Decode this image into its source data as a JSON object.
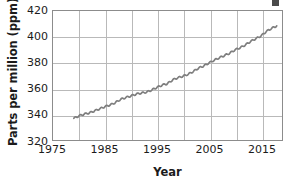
{
  "chart_data": {
    "type": "line",
    "title": "",
    "subtitle": "",
    "xlabel": "Year",
    "ylabel": "Parts per million (ppm)",
    "xlim": [
      1975,
      2019
    ],
    "ylim": [
      320,
      420
    ],
    "grid": true,
    "legend": null,
    "legend_position": "none",
    "x_ticks": [
      1975,
      1985,
      1995,
      2005,
      2015
    ],
    "x_tick_labels": [
      "1975",
      "1985",
      "1995",
      "2005",
      "2015"
    ],
    "x_gridline_values": [
      1975,
      1980,
      1985,
      1990,
      1995,
      2000,
      2005,
      2010,
      2015
    ],
    "y_ticks": [
      320,
      340,
      360,
      380,
      400,
      420
    ],
    "y_tick_labels": [
      "320",
      "340",
      "360",
      "380",
      "400",
      "420"
    ],
    "y_gridline_values": [
      320,
      340,
      360,
      380,
      400,
      420
    ],
    "series": [
      {
        "name": "Atmospheric CO2 concentration",
        "color": "#7e7e7e",
        "x": [
          1979,
          1980,
          1981,
          1982,
          1983,
          1984,
          1985,
          1986,
          1987,
          1988,
          1989,
          1990,
          1991,
          1992,
          1993,
          1994,
          1995,
          1996,
          1997,
          1998,
          1999,
          2000,
          2001,
          2002,
          2003,
          2004,
          2005,
          2006,
          2007,
          2008,
          2009,
          2010,
          2011,
          2012,
          2013,
          2014,
          2015,
          2016,
          2017,
          2018
        ],
        "values": [
          336.8,
          338.7,
          340.1,
          341.0,
          342.6,
          344.2,
          345.9,
          347.2,
          349.0,
          351.5,
          352.9,
          354.2,
          355.6,
          356.4,
          357.1,
          358.8,
          360.8,
          362.6,
          363.7,
          366.6,
          368.3,
          369.5,
          371.0,
          373.2,
          375.8,
          377.5,
          379.8,
          381.9,
          383.8,
          385.6,
          387.4,
          389.9,
          391.6,
          393.8,
          396.5,
          398.6,
          400.8,
          404.2,
          406.5,
          408.5
        ]
      }
    ]
  },
  "axes": {
    "y_title": "Parts per million (ppm)",
    "x_title": "Year"
  },
  "colors": {
    "line": "#7e7e7e",
    "gridline": "#b9b9b9",
    "frame": "#8c8c8c",
    "text": "#1b1b1b",
    "background": "#ffffff"
  }
}
